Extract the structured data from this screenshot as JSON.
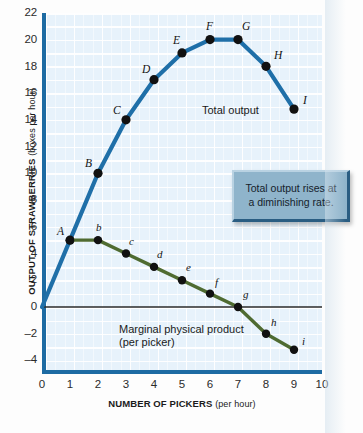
{
  "chart_data": {
    "type": "line",
    "title": "",
    "xlabel_main": "NUMBER OF PICKERS",
    "xlabel_sub": "(per hour)",
    "ylabel_main": "OUTPUT OF STRAWBERRIES",
    "ylabel_sub": "(boxes per hour)",
    "xlim": [
      0,
      10
    ],
    "ylim": [
      -4,
      22
    ],
    "xticks": [
      "0",
      "1",
      "2",
      "3",
      "4",
      "5",
      "6",
      "7",
      "8",
      "9",
      "10"
    ],
    "yticks": [
      "22",
      "20",
      "18",
      "16",
      "14",
      "12",
      "10",
      "8",
      "6",
      "4",
      "2",
      "0",
      "–2",
      "–4"
    ],
    "grid": true,
    "legend_position": "inline-annotations",
    "zero_line": 0,
    "series": [
      {
        "name": "Total output",
        "color": "#1f6fa8",
        "point_label_style": "uppercase-italic",
        "points": [
          {
            "label": "",
            "x": 0,
            "y": 0
          },
          {
            "label": "A",
            "x": 1,
            "y": 5
          },
          {
            "label": "B",
            "x": 2,
            "y": 10
          },
          {
            "label": "C",
            "x": 3,
            "y": 14
          },
          {
            "label": "D",
            "x": 4,
            "y": 17
          },
          {
            "label": "E",
            "x": 5,
            "y": 19
          },
          {
            "label": "F",
            "x": 6,
            "y": 20
          },
          {
            "label": "G",
            "x": 7,
            "y": 20
          },
          {
            "label": "H",
            "x": 8,
            "y": 18
          },
          {
            "label": "I",
            "x": 9,
            "y": 14.8
          }
        ]
      },
      {
        "name": "Marginal physical product",
        "color": "#4f6b31",
        "point_label_style": "lowercase-italic",
        "points": [
          {
            "label": "A",
            "x": 1,
            "y": 5
          },
          {
            "label": "b",
            "x": 2,
            "y": 5
          },
          {
            "label": "c",
            "x": 3,
            "y": 4
          },
          {
            "label": "d",
            "x": 4,
            "y": 3
          },
          {
            "label": "e",
            "x": 5,
            "y": 2
          },
          {
            "label": "f",
            "x": 6,
            "y": 1
          },
          {
            "label": "g",
            "x": 7,
            "y": 0
          },
          {
            "label": "h",
            "x": 8,
            "y": -2
          },
          {
            "label": "i",
            "x": 9,
            "y": -3.2
          }
        ]
      }
    ],
    "annotations": [
      {
        "name": "total-output-label",
        "text": "Total output"
      },
      {
        "name": "mpp-label-line1",
        "text": "Marginal physical product"
      },
      {
        "name": "mpp-label-line2",
        "text": "(per picker)"
      }
    ]
  },
  "callout": {
    "line1": "Total output rises at",
    "line2": "a diminishing rate.",
    "bg_color": "#8fb4cb"
  },
  "colors": {
    "plot_background": "#e7f2fb",
    "axis": "#1d6ba3",
    "total_output": "#1f6fa8",
    "marginal_product": "#4f6b31",
    "point_marker": "#111111",
    "zero_line": "#2a2a2a"
  }
}
